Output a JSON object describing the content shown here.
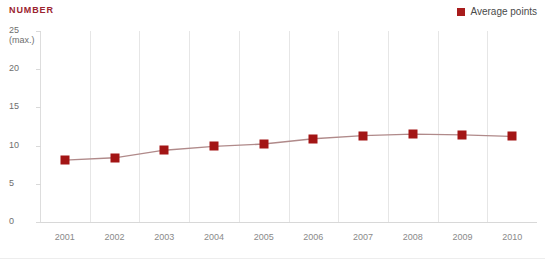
{
  "header": {
    "axis_title": "NUMBER"
  },
  "legend": {
    "position": "top-right",
    "entries": [
      {
        "label": "Average points",
        "color": "#a81c1c",
        "icon": "square-marker-icon"
      }
    ]
  },
  "colors": {
    "title": "#9b2430",
    "series": "#a31515",
    "line": "#b08a8a",
    "grid": "#e6e6e6",
    "tick_text": "#8a8a8a"
  },
  "chart_data": {
    "type": "line",
    "title": "NUMBER",
    "xlabel": "",
    "ylabel": "NUMBER",
    "ylim": [
      0,
      25
    ],
    "yticks": [
      "0",
      "5",
      "10",
      "15",
      "20",
      "25"
    ],
    "ytick_top_note": "(max.)",
    "grid": "vertical",
    "legend_position": "top-right",
    "categories": [
      "2001",
      "2002",
      "2003",
      "2004",
      "2005",
      "2006",
      "2007",
      "2008",
      "2009",
      "2010"
    ],
    "series": [
      {
        "name": "Average points",
        "color": "#a31515",
        "values": [
          8.1,
          8.4,
          9.4,
          9.9,
          10.2,
          10.9,
          11.3,
          11.5,
          11.4,
          11.2
        ]
      }
    ]
  }
}
